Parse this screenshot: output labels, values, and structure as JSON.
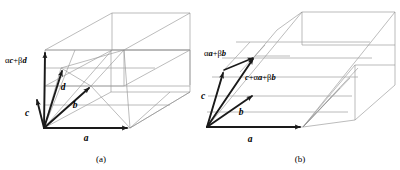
{
  "figure": {
    "background_color": "#ffffff",
    "line_color": "#8e8e8e",
    "vector_color": "#1a1a1a",
    "panels": [
      {
        "id": "a",
        "caption": "(a)",
        "caption_pos": {
          "x": 101,
          "y": 160
        },
        "origin": {
          "x": 44,
          "y": 128
        },
        "vectors": [
          {
            "name": "a",
            "label": "a",
            "tip": {
              "x": 130,
              "y": 128
            },
            "label_pos": {
              "x": 86,
              "y": 140
            }
          },
          {
            "name": "b",
            "label": "b",
            "tip": {
              "x": 91,
              "y": 86
            },
            "label_pos": {
              "x": 75,
              "y": 106
            }
          },
          {
            "name": "c",
            "label": "c",
            "tip": {
              "x": 36,
              "y": 98
            },
            "label_pos": {
              "x": 26,
              "y": 113
            }
          },
          {
            "name": "d",
            "label": "d",
            "tip": {
              "x": 61,
              "y": 68
            },
            "label_pos": {
              "x": 62,
              "y": 88
            }
          },
          {
            "name": "alpha-c-plus-beta-d",
            "label": "αc+βd",
            "tip": {
              "x": 45,
              "y": 50
            },
            "label_pos": {
              "x": 8,
              "y": 62
            }
          }
        ],
        "label_parts": {
          "alpha_c_beta_d": [
            {
              "text": "α",
              "italic": false
            },
            {
              "text": "c",
              "italic": true
            },
            {
              "text": "+β",
              "italic": false
            },
            {
              "text": "d",
              "italic": true
            }
          ]
        }
      },
      {
        "id": "b",
        "caption": "(b)",
        "caption_pos": {
          "x": 300,
          "y": 160
        },
        "origin": {
          "x": 207,
          "y": 127
        },
        "vectors": [
          {
            "name": "a",
            "label": "a",
            "tip": {
              "x": 303,
              "y": 127
            },
            "label_pos": {
              "x": 250,
              "y": 140
            }
          },
          {
            "name": "b",
            "label": "b",
            "tip": {
              "x": 254,
              "y": 94
            },
            "label_pos": {
              "x": 240,
              "y": 112
            }
          },
          {
            "name": "c",
            "label": "c",
            "tip": {
              "x": 224,
              "y": 70
            },
            "label_pos": {
              "x": 203,
              "y": 95
            }
          },
          {
            "name": "alpha-a-plus-beta-b",
            "label": "αa+βb",
            "tip": {
              "x": 255,
              "y": 56
            },
            "label_pos": {
              "x": 205,
              "y": 53
            }
          },
          {
            "name": "c-plus-alpha-a-plus-beta-b",
            "label": "c+αa+βb",
            "tip": {
              "x": 254,
              "y": 94
            },
            "label_pos": {
              "x": 246,
              "y": 77
            }
          }
        ],
        "label_parts": {
          "alpha_a_beta_b": [
            {
              "text": "α",
              "italic": false
            },
            {
              "text": "a",
              "italic": true
            },
            {
              "text": "+β",
              "italic": false
            },
            {
              "text": "b",
              "italic": true
            }
          ],
          "c_alpha_a_beta_b": [
            {
              "text": "c",
              "italic": true
            },
            {
              "text": "+α",
              "italic": false
            },
            {
              "text": "a",
              "italic": true
            },
            {
              "text": "+β",
              "italic": false
            },
            {
              "text": "b",
              "italic": true
            }
          ]
        }
      }
    ]
  },
  "labels": {
    "a_vec": "a",
    "b_vec": "b",
    "c_vec": "c",
    "d_vec": "d",
    "alpha_c_beta_d": "αc+βd",
    "alpha_a_beta_b": "αa+βb",
    "c_alpha_a_beta_b": "c+αa+βb",
    "caption_a": "(a)",
    "caption_b": "(b)"
  },
  "glyphs": {
    "alpha": "α",
    "beta": "β",
    "plus": "+"
  }
}
